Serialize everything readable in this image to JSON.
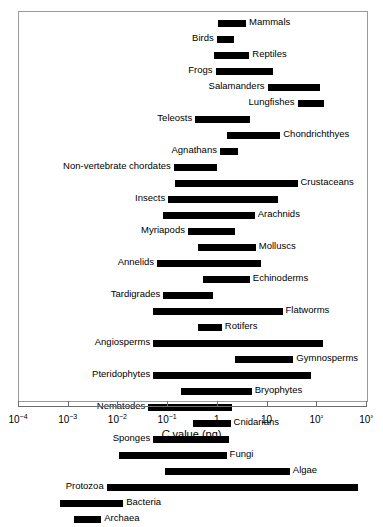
{
  "chart_data": {
    "type": "bar",
    "orientation": "horizontal-range",
    "title": "",
    "subtitle": "",
    "xlabel": "C value (pg)",
    "ylabel": "",
    "xscale": "log",
    "xlim": [
      0.0001,
      1000
    ],
    "grid": false,
    "legend": null,
    "tick_labels": [
      "10−4",
      "10−3",
      "10−2",
      "10−1",
      "1",
      "10",
      "10²",
      "10³"
    ],
    "tick_values": [
      0.0001,
      0.001,
      0.01,
      0.1,
      1,
      10,
      100,
      1000
    ],
    "bar_color": "#000000",
    "frame_color": "#9a9a9a",
    "axis_color": "#6e6e6e",
    "categories": [
      "Mammals",
      "Birds",
      "Reptiles",
      "Frogs",
      "Salamanders",
      "Lungfishes",
      "Teleosts",
      "Chondrichthyes",
      "Agnathans",
      "Non-vertebrate chordates",
      "Crustaceans",
      "Insects",
      "Arachnids",
      "Myriapods",
      "Molluscs",
      "Annelids",
      "Echinoderms",
      "Tardigrades",
      "Flatworms",
      "Rotifers",
      "Angiosperms",
      "Gymnosperms",
      "Pteridophytes",
      "Bryophytes",
      "Nematodes",
      "Cnidarians",
      "Sponges",
      "Fungi",
      "Algae",
      "Protozoa",
      "Bacteria",
      "Archaea"
    ],
    "bars": [
      {
        "label": "Mammals",
        "min": 1.0,
        "max": 3.7,
        "label_side": "right"
      },
      {
        "label": "Birds",
        "min": 0.95,
        "max": 2.1,
        "label_side": "left"
      },
      {
        "label": "Reptiles",
        "min": 0.85,
        "max": 4.3,
        "label_side": "right"
      },
      {
        "label": "Frogs",
        "min": 0.9,
        "max": 13.0,
        "label_side": "left"
      },
      {
        "label": "Salamanders",
        "min": 10.0,
        "max": 115.0,
        "label_side": "left"
      },
      {
        "label": "Lungfishes",
        "min": 40.0,
        "max": 135.0,
        "label_side": "left"
      },
      {
        "label": "Teleosts",
        "min": 0.35,
        "max": 4.5,
        "label_side": "left"
      },
      {
        "label": "Chondrichthyes",
        "min": 1.5,
        "max": 18.0,
        "label_side": "right"
      },
      {
        "label": "Agnathans",
        "min": 1.1,
        "max": 2.5,
        "label_side": "left"
      },
      {
        "label": "Non-vertebrate chordates",
        "min": 0.13,
        "max": 0.95,
        "label_side": "left"
      },
      {
        "label": "Crustaceans",
        "min": 0.14,
        "max": 40.0,
        "label_side": "right"
      },
      {
        "label": "Insects",
        "min": 0.1,
        "max": 16.0,
        "label_side": "left"
      },
      {
        "label": "Arachnids",
        "min": 0.08,
        "max": 5.5,
        "label_side": "right"
      },
      {
        "label": "Myriapods",
        "min": 0.25,
        "max": 2.2,
        "label_side": "left"
      },
      {
        "label": "Molluscs",
        "min": 0.4,
        "max": 5.8,
        "label_side": "right"
      },
      {
        "label": "Annelids",
        "min": 0.06,
        "max": 7.5,
        "label_side": "left"
      },
      {
        "label": "Echinoderms",
        "min": 0.5,
        "max": 4.4,
        "label_side": "right"
      },
      {
        "label": "Tardigrades",
        "min": 0.08,
        "max": 0.8,
        "label_side": "left"
      },
      {
        "label": "Flatworms",
        "min": 0.05,
        "max": 20.0,
        "label_side": "right"
      },
      {
        "label": "Rotifers",
        "min": 0.4,
        "max": 1.2,
        "label_side": "right"
      },
      {
        "label": "Angiosperms",
        "min": 0.05,
        "max": 130.0,
        "label_side": "left"
      },
      {
        "label": "Gymnosperms",
        "min": 2.2,
        "max": 33.0,
        "label_side": "right"
      },
      {
        "label": "Pteridophytes",
        "min": 0.05,
        "max": 75.0,
        "label_side": "left"
      },
      {
        "label": "Bryophytes",
        "min": 0.18,
        "max": 4.8,
        "label_side": "right"
      },
      {
        "label": "Nematodes",
        "min": 0.04,
        "max": 1.9,
        "label_side": "left"
      },
      {
        "label": "Cnidarians",
        "min": 0.32,
        "max": 1.8,
        "label_side": "right"
      },
      {
        "label": "Sponges",
        "min": 0.05,
        "max": 1.7,
        "label_side": "left"
      },
      {
        "label": "Fungi",
        "min": 0.0105,
        "max": 1.5,
        "label_side": "right"
      },
      {
        "label": "Algae",
        "min": 0.088,
        "max": 28.0,
        "label_side": "right"
      },
      {
        "label": "Protozoa",
        "min": 0.0058,
        "max": 660.0,
        "label_side": "left"
      },
      {
        "label": "Bacteria",
        "min": 0.00066,
        "max": 0.0125,
        "label_side": "right"
      },
      {
        "label": "Archaea",
        "min": 0.00125,
        "max": 0.0045,
        "label_side": "right"
      }
    ]
  },
  "axis": {
    "title_prefix": "C",
    "title_suffix": " value (pg)"
  }
}
